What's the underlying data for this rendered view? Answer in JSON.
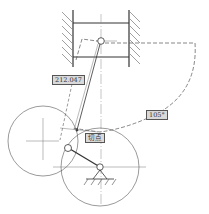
{
  "diagram": {
    "colors": {
      "line": "#333333",
      "thin": "#666666",
      "dashed": "#555555",
      "hatch": "#666666",
      "label_bg": "#d9d9d9",
      "label_border": "#555555"
    },
    "labels": {
      "length": "212.047",
      "tangent_point": "切点",
      "angle": "105°"
    },
    "components": [
      "cylinder-wall-left",
      "cylinder-wall-right",
      "piston",
      "piston-pin",
      "connecting-rod",
      "crank-arm",
      "crank-pin",
      "crank-pivot-support",
      "left-construction-circle",
      "crank-circle",
      "dashed-locus-arc"
    ]
  }
}
